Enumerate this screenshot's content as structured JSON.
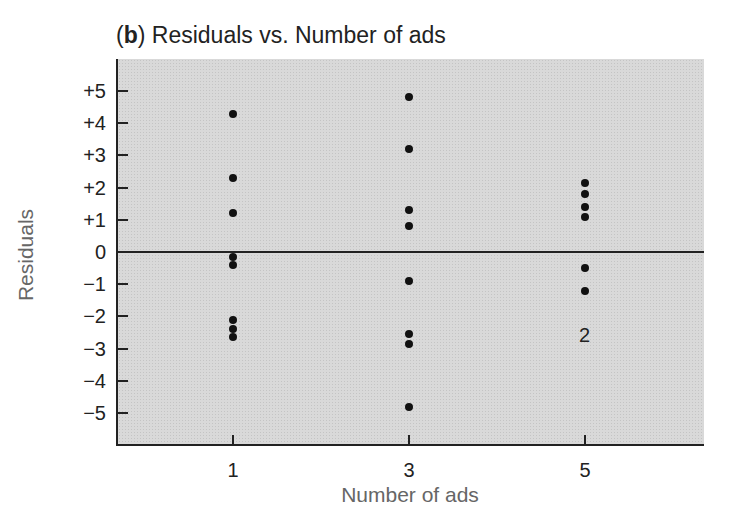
{
  "chart_data": {
    "type": "scatter",
    "title_prefix": "b",
    "title": "Residuals vs. Number of ads",
    "xlabel": "Number of ads",
    "ylabel": "Residuals",
    "x_ticks": [
      "1",
      "3",
      "5"
    ],
    "y_ticks": [
      "+5",
      "+4",
      "+3",
      "+2",
      "+1",
      "0",
      "−1",
      "−2",
      "−3",
      "−4",
      "−5"
    ],
    "ylim": [
      -6,
      6
    ],
    "xlim": [
      0,
      6.5
    ],
    "grid": false,
    "reference_line": 0,
    "points": [
      {
        "x": 1,
        "y": 4.3
      },
      {
        "x": 1,
        "y": 2.3
      },
      {
        "x": 1,
        "y": 1.2
      },
      {
        "x": 1,
        "y": -0.15
      },
      {
        "x": 1,
        "y": -0.4
      },
      {
        "x": 1,
        "y": -2.1
      },
      {
        "x": 1,
        "y": -2.4
      },
      {
        "x": 1,
        "y": -2.65
      },
      {
        "x": 3,
        "y": 4.8
      },
      {
        "x": 3,
        "y": 3.2
      },
      {
        "x": 3,
        "y": 1.3
      },
      {
        "x": 3,
        "y": 0.8
      },
      {
        "x": 3,
        "y": -0.9
      },
      {
        "x": 3,
        "y": -2.55
      },
      {
        "x": 3,
        "y": -2.85
      },
      {
        "x": 3,
        "y": -4.8
      },
      {
        "x": 5,
        "y": 2.15
      },
      {
        "x": 5,
        "y": 1.8
      },
      {
        "x": 5,
        "y": 1.4
      },
      {
        "x": 5,
        "y": 1.1
      },
      {
        "x": 5,
        "y": -0.5
      },
      {
        "x": 5,
        "y": -1.2
      }
    ],
    "annotations": [
      {
        "x": 5,
        "y": -2.6,
        "text": "2"
      }
    ]
  }
}
